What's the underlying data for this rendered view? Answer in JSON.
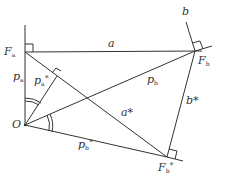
{
  "diagram": {
    "type": "geometry-construction",
    "points": {
      "O": {
        "label": "O",
        "x": 25,
        "y": 125
      },
      "Fa": {
        "label": "F",
        "sub": "a",
        "x": 25,
        "y": 52
      },
      "Fb": {
        "label": "F",
        "sub": "b",
        "x": 195,
        "y": 51
      },
      "Fb_star": {
        "label": "F",
        "sub": "b",
        "sup": "*",
        "x": 167,
        "y": 157
      }
    },
    "labels": {
      "a": "a",
      "b": "b",
      "pa": "p",
      "pa_sub": "a",
      "pa_star": "p",
      "pa_star_sub": "a",
      "pb": "p",
      "pb_sub": "b",
      "pb_star": "p",
      "pb_star_sub": "b",
      "a_star": "a*",
      "b_star": "b*",
      "star": "*"
    },
    "segments": [
      {
        "name": "a",
        "from": "Fa",
        "to": "Fb"
      },
      {
        "name": "pa",
        "from": "O",
        "to": "Fa"
      },
      {
        "name": "pb",
        "from": "O",
        "to": "Fb"
      },
      {
        "name": "pb_star",
        "from": "O",
        "to": "Fb_star"
      },
      {
        "name": "a_star",
        "from": "Fa",
        "to": "Fb_star"
      },
      {
        "name": "b_star",
        "from": "Fb",
        "to": "Fb_star"
      },
      {
        "name": "pa_star",
        "from": "O",
        "to": "foot_on_a_star"
      }
    ],
    "right_angles": [
      "Fa",
      "Fb",
      "Fb_star",
      "foot_on_a_star"
    ],
    "equal_angle_marks": [
      "angle Fa-O-foot (double arc)",
      "angle Fb-O-Fb_star (double arc)"
    ]
  }
}
